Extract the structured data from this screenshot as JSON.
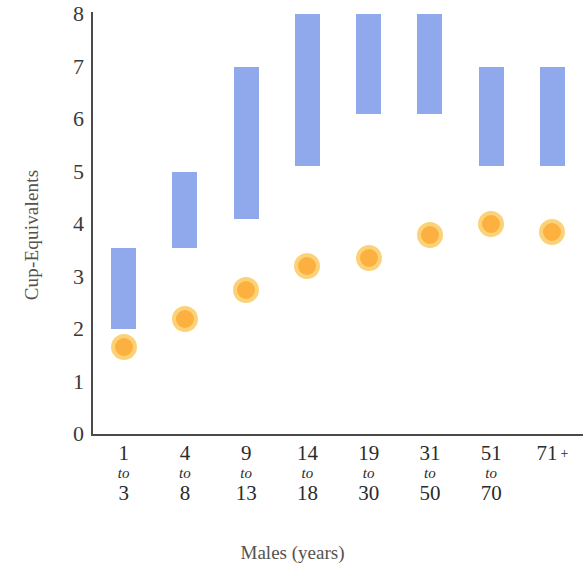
{
  "chart_data": {
    "type": "bar",
    "title": "",
    "subtitle": "",
    "xlabel": "Males (years)",
    "ylabel": "Cup-Equivalents",
    "categories": [
      "1 to 3",
      "4 to 8",
      "9 to 13",
      "14 to 18",
      "19 to 30",
      "31 to 50",
      "51 to 70",
      "71 +"
    ],
    "category_labels": [
      {
        "from": "1",
        "to": "to",
        "until": "3",
        "plus": ""
      },
      {
        "from": "4",
        "to": "to",
        "until": "8",
        "plus": ""
      },
      {
        "from": "9",
        "to": "to",
        "until": "13",
        "plus": ""
      },
      {
        "from": "14",
        "to": "to",
        "until": "18",
        "plus": ""
      },
      {
        "from": "19",
        "to": "to",
        "until": "30",
        "plus": ""
      },
      {
        "from": "31",
        "to": "to",
        "until": "50",
        "plus": ""
      },
      {
        "from": "51",
        "to": "to",
        "until": "70",
        "plus": ""
      },
      {
        "from": "71",
        "to": "",
        "until": "",
        "plus": "+"
      }
    ],
    "ylim": [
      0,
      8
    ],
    "yticks": [
      0,
      1,
      2,
      3,
      4,
      5,
      6,
      7,
      8
    ],
    "ytick_labels": [
      "0",
      "1",
      "2",
      "3",
      "4",
      "5",
      "6",
      "7",
      "8"
    ],
    "grid": false,
    "legend": "none",
    "series": [
      {
        "name": "Recommended range",
        "type": "range-bar",
        "color": "#8fa9ec",
        "low": [
          2.0,
          3.55,
          4.1,
          5.1,
          6.1,
          6.1,
          5.1,
          5.1
        ],
        "high": [
          3.55,
          5.0,
          7.0,
          8.0,
          8.0,
          8.0,
          7.0,
          7.0
        ]
      },
      {
        "name": "Average intake",
        "type": "marker",
        "color": "#fbb040",
        "ring_color": "#fcd279",
        "values": [
          1.65,
          2.2,
          2.75,
          3.2,
          3.35,
          3.8,
          4.0,
          3.85
        ]
      }
    ]
  },
  "colors": {
    "bar": "#8fa9ec",
    "marker_fill": "#fbb040",
    "marker_ring": "#fcd279",
    "axis": "#4a4a4a",
    "text": "#2b2b2b",
    "axis_title": "#56524f",
    "background": "#ffffff"
  }
}
